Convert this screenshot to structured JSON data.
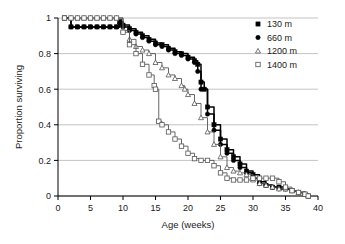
{
  "chart_data": {
    "type": "line",
    "title": "",
    "xlabel": "Age (weeks)",
    "ylabel": "Proportion surviving",
    "xlim": [
      0,
      40
    ],
    "ylim": [
      0,
      1
    ],
    "xticks": [
      0,
      5,
      10,
      15,
      20,
      25,
      30,
      35,
      40
    ],
    "xtick_labels": [
      "0",
      "5",
      "10",
      "15",
      "20",
      "25",
      "30",
      "35",
      "40"
    ],
    "yticks": [
      0,
      0.2,
      0.4,
      0.6,
      0.8,
      1
    ],
    "ytick_labels": [
      "0",
      "0.2",
      "0.4",
      "0.6",
      "0.8",
      "1"
    ],
    "grid": "horizontal",
    "legend_position": "top-right",
    "series": [
      {
        "name": "130 m",
        "marker": "filled-square",
        "color": "#000000",
        "x": [
          1,
          2,
          3,
          4,
          5,
          6,
          7,
          8,
          9,
          9.5,
          10,
          11,
          12,
          13,
          14,
          15,
          16,
          17,
          18,
          19,
          20,
          21,
          21.5,
          22,
          22.5,
          23,
          24,
          25,
          26,
          27,
          28,
          29,
          30,
          31,
          32,
          33,
          34,
          35,
          36,
          37,
          38,
          38.5
        ],
        "y": [
          1.0,
          0.95,
          0.95,
          0.95,
          0.95,
          0.95,
          0.95,
          0.95,
          0.95,
          0.98,
          0.96,
          0.94,
          0.92,
          0.9,
          0.88,
          0.86,
          0.85,
          0.83,
          0.81,
          0.8,
          0.78,
          0.76,
          0.74,
          0.64,
          0.6,
          0.5,
          0.4,
          0.32,
          0.26,
          0.22,
          0.18,
          0.14,
          0.12,
          0.08,
          0.06,
          0.05,
          0.05,
          0.04,
          0.03,
          0.02,
          0.01,
          0.0
        ]
      },
      {
        "name": "660 m",
        "marker": "filled-circle",
        "color": "#000000",
        "x": [
          1,
          2,
          3,
          4,
          5,
          6,
          7,
          8,
          9,
          9.5,
          10,
          11,
          12,
          13,
          14,
          15,
          16,
          17,
          18,
          19,
          20,
          21,
          21.5,
          22,
          23,
          24,
          25,
          26,
          27,
          28,
          29,
          30,
          31,
          32,
          33,
          34,
          35,
          36,
          37,
          38,
          38.5
        ],
        "y": [
          1.0,
          0.95,
          0.95,
          0.95,
          0.95,
          0.95,
          0.95,
          0.95,
          0.95,
          0.97,
          0.95,
          0.93,
          0.91,
          0.89,
          0.87,
          0.85,
          0.84,
          0.82,
          0.8,
          0.79,
          0.77,
          0.75,
          0.7,
          0.6,
          0.46,
          0.37,
          0.29,
          0.24,
          0.2,
          0.16,
          0.13,
          0.1,
          0.07,
          0.06,
          0.05,
          0.04,
          0.04,
          0.03,
          0.02,
          0.01,
          0.0
        ]
      },
      {
        "name": "1200 m",
        "marker": "open-triangle",
        "color": "#555555",
        "x": [
          1,
          2,
          3,
          4,
          5,
          6,
          7,
          8,
          9,
          10,
          11,
          12,
          13,
          14,
          15,
          16,
          17,
          18,
          19,
          19.5,
          20,
          21,
          22,
          23,
          24,
          25,
          26,
          27,
          28,
          29,
          30,
          31,
          32,
          33,
          34,
          35,
          36,
          37,
          38,
          38.5
        ],
        "y": [
          1.0,
          1.0,
          1.0,
          1.0,
          1.0,
          1.0,
          1.0,
          1.0,
          1.0,
          0.93,
          0.88,
          0.84,
          0.82,
          0.8,
          0.75,
          0.72,
          0.68,
          0.66,
          0.62,
          0.6,
          0.57,
          0.52,
          0.44,
          0.36,
          0.29,
          0.22,
          0.16,
          0.14,
          0.13,
          0.12,
          0.09,
          0.07,
          0.06,
          0.05,
          0.04,
          0.04,
          0.03,
          0.02,
          0.01,
          0.0
        ]
      },
      {
        "name": "1400 m",
        "marker": "open-square",
        "color": "#555555",
        "x": [
          1,
          2,
          3,
          4,
          5,
          6,
          7,
          8,
          9,
          10,
          11,
          12,
          13,
          14,
          14.8,
          15,
          15.5,
          16,
          17,
          18,
          19,
          20,
          21,
          22,
          23,
          24,
          25,
          26,
          27,
          28,
          29,
          30,
          31,
          32,
          33,
          34,
          35,
          36,
          37,
          38,
          38.5
        ],
        "y": [
          1.0,
          1.0,
          1.0,
          1.0,
          1.0,
          1.0,
          1.0,
          1.0,
          1.0,
          0.92,
          0.85,
          0.8,
          0.74,
          0.68,
          0.62,
          0.6,
          0.42,
          0.4,
          0.36,
          0.32,
          0.28,
          0.24,
          0.21,
          0.2,
          0.2,
          0.17,
          0.13,
          0.1,
          0.09,
          0.09,
          0.09,
          0.1,
          0.1,
          0.1,
          0.1,
          0.08,
          0.05,
          0.03,
          0.02,
          0.01,
          0.0
        ]
      }
    ]
  }
}
